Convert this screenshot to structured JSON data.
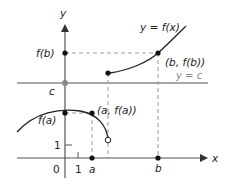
{
  "diagram": {
    "type": "piecewise-function-graph",
    "axes": {
      "x_label": "x",
      "y_label": "y",
      "origin_label": "0",
      "x_tick_label": "1",
      "y_tick_label": "1"
    },
    "labels": {
      "f_of_b": "f(b)",
      "f_of_a": "f(a)",
      "c": "c",
      "a": "a",
      "b": "b",
      "curve": "y = f(x)",
      "point_b": "(b, f(b))",
      "point_a": "(a, f(a))",
      "line_c": "y = c"
    },
    "colors": {
      "axis": "#555555",
      "curve": "#222222",
      "dash": "#9a9a9a",
      "line_c": "#8a8a8a",
      "point": "#111111",
      "c_point": "#888888"
    }
  }
}
